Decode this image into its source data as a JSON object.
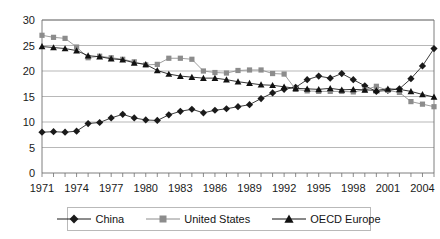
{
  "chart_data": {
    "type": "line",
    "title": "",
    "xlabel": "",
    "ylabel": "",
    "ylim": [
      0,
      30
    ],
    "yticks": [
      0,
      5,
      10,
      15,
      20,
      25,
      30
    ],
    "xlim": [
      1971,
      2005
    ],
    "xticks_shown": [
      "1971",
      "1974",
      "1977",
      "1980",
      "1983",
      "1986",
      "1989",
      "1992",
      "1995",
      "1998",
      "2001",
      "2004"
    ],
    "x": [
      1971,
      1972,
      1973,
      1974,
      1975,
      1976,
      1977,
      1978,
      1979,
      1980,
      1981,
      1982,
      1983,
      1984,
      1985,
      1986,
      1987,
      1988,
      1989,
      1990,
      1991,
      1992,
      1993,
      1994,
      1995,
      1996,
      1997,
      1998,
      1999,
      2000,
      2001,
      2002,
      2003,
      2004,
      2005
    ],
    "grid": true,
    "legend_position": "bottom",
    "series": [
      {
        "name": "China",
        "marker": "diamond",
        "color": "#1a1a1a",
        "values": [
          8.0,
          8.1,
          8.0,
          8.2,
          9.7,
          9.9,
          10.8,
          11.5,
          10.8,
          10.4,
          10.3,
          11.4,
          12.1,
          12.5,
          11.8,
          12.3,
          12.6,
          13.0,
          13.4,
          14.6,
          15.7,
          16.4,
          16.8,
          18.3,
          19.0,
          18.6,
          19.5,
          18.3,
          17.1,
          16.0,
          16.2,
          16.5,
          18.5,
          21.0,
          24.4
        ]
      },
      {
        "name": "United States",
        "marker": "square",
        "color": "#8c8c8c",
        "values": [
          27.0,
          26.6,
          26.4,
          24.7,
          22.6,
          22.9,
          22.6,
          22.3,
          21.8,
          21.2,
          21.3,
          22.5,
          22.5,
          22.3,
          20.0,
          19.7,
          19.6,
          20.1,
          20.2,
          20.2,
          19.5,
          19.4,
          16.4,
          16.1,
          16.0,
          16.0,
          16.0,
          15.9,
          16.3,
          17.0,
          16.2,
          15.8,
          14.0,
          13.5,
          13.0
        ]
      },
      {
        "name": "OECD Europe",
        "marker": "triangle",
        "color": "#111111",
        "values": [
          24.8,
          24.6,
          24.4,
          24.0,
          23.0,
          22.8,
          22.4,
          22.2,
          21.6,
          21.3,
          20.1,
          19.4,
          19.0,
          18.8,
          18.6,
          18.6,
          18.3,
          17.9,
          17.6,
          17.3,
          17.2,
          16.9,
          16.6,
          16.5,
          16.4,
          16.6,
          16.3,
          16.4,
          16.3,
          16.2,
          16.5,
          16.4,
          16.0,
          15.4,
          14.9
        ]
      }
    ]
  },
  "legend": {
    "items": [
      {
        "label": "China",
        "marker": "diamond"
      },
      {
        "label": "United States",
        "marker": "square"
      },
      {
        "label": "OECD Europe",
        "marker": "triangle"
      }
    ]
  },
  "colors": {
    "china": "#1a1a1a",
    "united_states": "#8c8c8c",
    "oecd_europe": "#111111",
    "grid": "#9a9a9a",
    "axis": "#6f6f6f",
    "text": "#141414"
  }
}
